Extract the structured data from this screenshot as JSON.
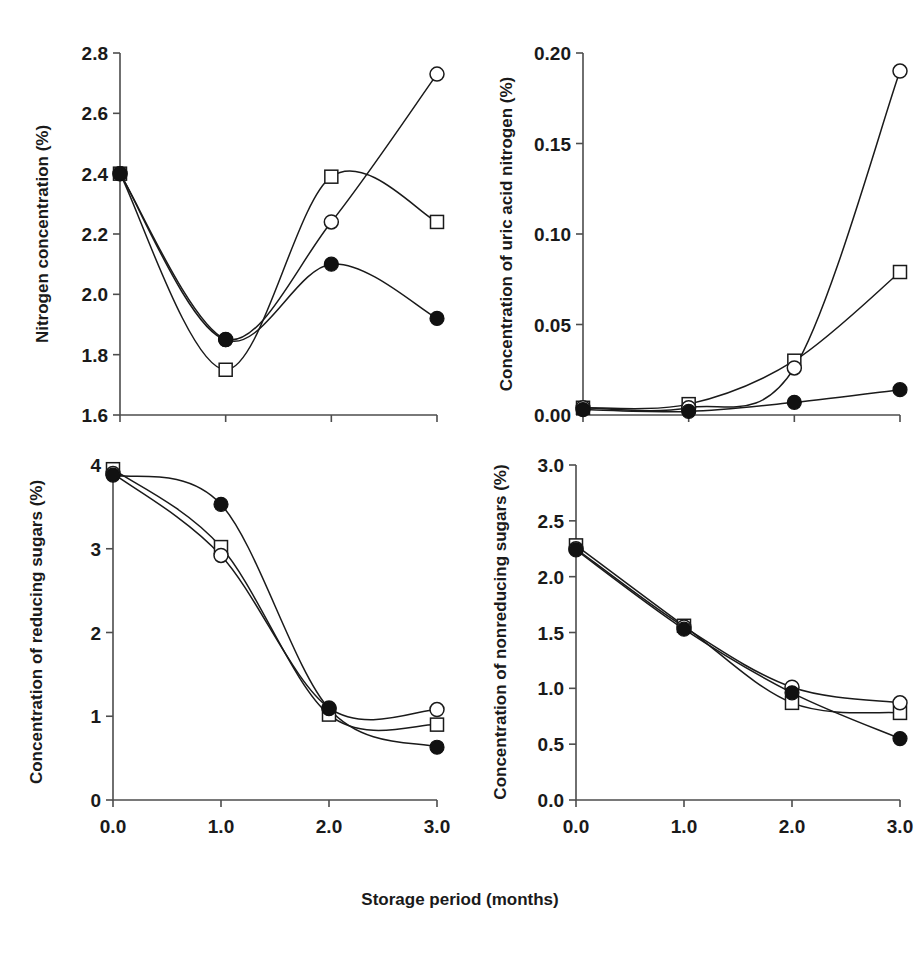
{
  "figure": {
    "xlabel": "Storage period (months)",
    "x_tick_labels": [
      "0.0",
      "1.0",
      "2.0",
      "3.0"
    ]
  },
  "chart_data": [
    {
      "id": "panel-nitrogen",
      "position": "top-left",
      "type": "line",
      "title": "",
      "ylabel": "Nitrogen concentration (%)",
      "xlabel": "Storage period (months)",
      "x": [
        0.0,
        1.0,
        2.0,
        3.0
      ],
      "xlim": [
        0.0,
        3.0
      ],
      "ylim": [
        1.6,
        2.8
      ],
      "xticks": [
        0.0,
        1.0,
        2.0,
        3.0
      ],
      "yticks": [
        1.6,
        1.8,
        2.0,
        2.2,
        2.4,
        2.6,
        2.8
      ],
      "ytick_labels": [
        "1.6",
        "1.8",
        "2.0",
        "2.2",
        "2.4",
        "2.6",
        "2.8"
      ],
      "xtick_labels": [
        "0.0",
        "1.0",
        "2.0",
        "3.0"
      ],
      "grid": false,
      "legend": "none",
      "interpolation": "smooth-spline",
      "series": [
        {
          "name": "open-square",
          "marker": "open-square",
          "values": [
            2.4,
            1.75,
            2.39,
            2.24
          ]
        },
        {
          "name": "open-circle",
          "marker": "open-circle",
          "values": [
            2.4,
            1.85,
            2.24,
            2.73
          ]
        },
        {
          "name": "filled-circle",
          "marker": "filled-circle",
          "values": [
            2.4,
            1.85,
            2.1,
            1.92
          ]
        }
      ]
    },
    {
      "id": "panel-uric-acid",
      "position": "top-right",
      "type": "line",
      "title": "",
      "ylabel": "Concentration of uric acid nitrogen (%)",
      "xlabel": "Storage period (months)",
      "x": [
        0.0,
        1.0,
        2.0,
        3.0
      ],
      "xlim": [
        0.0,
        3.0
      ],
      "ylim": [
        0.0,
        0.2
      ],
      "xticks": [
        0.0,
        1.0,
        2.0,
        3.0
      ],
      "yticks": [
        0.0,
        0.05,
        0.1,
        0.15,
        0.2
      ],
      "ytick_labels": [
        "0.00",
        "0.05",
        "0.10",
        "0.15",
        "0.20"
      ],
      "xtick_labels": [
        "0.0",
        "1.0",
        "2.0",
        "3.0"
      ],
      "grid": false,
      "legend": "none",
      "interpolation": "smooth-spline",
      "series": [
        {
          "name": "open-square",
          "marker": "open-square",
          "values": [
            0.004,
            0.006,
            0.03,
            0.079
          ]
        },
        {
          "name": "open-circle",
          "marker": "open-circle",
          "values": [
            0.004,
            0.004,
            0.026,
            0.19
          ]
        },
        {
          "name": "filled-circle",
          "marker": "filled-circle",
          "values": [
            0.003,
            0.002,
            0.007,
            0.014
          ]
        }
      ]
    },
    {
      "id": "panel-reducing-sugars",
      "position": "bottom-left",
      "type": "line",
      "title": "",
      "ylabel": "Concentration of reducing sugars (%)",
      "xlabel": "Storage period (months)",
      "x": [
        0.0,
        1.0,
        2.0,
        3.0
      ],
      "xlim": [
        0.0,
        3.0
      ],
      "ylim": [
        0.0,
        4.0
      ],
      "xticks": [
        0.0,
        1.0,
        2.0,
        3.0
      ],
      "yticks": [
        0,
        1,
        2,
        3,
        4
      ],
      "ytick_labels": [
        "0",
        "1",
        "2",
        "3",
        "4"
      ],
      "xtick_labels": [
        "0.0",
        "1.0",
        "2.0",
        "3.0"
      ],
      "grid": false,
      "legend": "none",
      "interpolation": "smooth-spline",
      "series": [
        {
          "name": "open-square",
          "marker": "open-square",
          "values": [
            3.95,
            3.02,
            1.02,
            0.9
          ]
        },
        {
          "name": "open-circle",
          "marker": "open-circle",
          "values": [
            3.9,
            2.92,
            1.1,
            1.08
          ]
        },
        {
          "name": "filled-circle",
          "marker": "filled-circle",
          "values": [
            3.88,
            3.53,
            1.09,
            0.63
          ]
        }
      ]
    },
    {
      "id": "panel-nonreducing-sugars",
      "position": "bottom-right",
      "type": "line",
      "title": "",
      "ylabel": "Concentration of nonreducing sugars (%)",
      "xlabel": "Storage period (months)",
      "x": [
        0.0,
        1.0,
        2.0,
        3.0
      ],
      "xlim": [
        0.0,
        3.0
      ],
      "ylim": [
        0.0,
        3.0
      ],
      "xticks": [
        0.0,
        1.0,
        2.0,
        3.0
      ],
      "yticks": [
        0.0,
        0.5,
        1.0,
        1.5,
        2.0,
        2.5,
        3.0
      ],
      "ytick_labels": [
        "0.0",
        "0.5",
        "1.0",
        "1.5",
        "2.0",
        "2.5",
        "3.0"
      ],
      "xtick_labels": [
        "0.0",
        "1.0",
        "2.0",
        "3.0"
      ],
      "grid": false,
      "legend": "none",
      "interpolation": "smooth-spline",
      "series": [
        {
          "name": "open-square",
          "marker": "open-square",
          "values": [
            2.28,
            1.56,
            0.87,
            0.78
          ]
        },
        {
          "name": "open-circle",
          "marker": "open-circle",
          "values": [
            2.25,
            1.55,
            1.01,
            0.87
          ]
        },
        {
          "name": "filled-circle",
          "marker": "filled-circle",
          "values": [
            2.24,
            1.53,
            0.96,
            0.55
          ]
        }
      ]
    }
  ],
  "colors": {
    "axis": "#4d4d4d",
    "line": "#1a1a1a",
    "marker_fill_open": "#ffffff",
    "marker_fill_solid": "#111111",
    "text": "#1a1a1a",
    "background": "#ffffff"
  }
}
